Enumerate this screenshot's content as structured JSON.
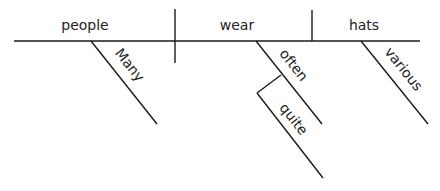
{
  "diagram": {
    "type": "sentence-diagram",
    "sentence_words": {
      "subject": "people",
      "verb": "wear",
      "object": "hats",
      "subject_modifier": "Many",
      "verb_modifier": "often",
      "adverb_modifier": "quite",
      "object_modifier": "various"
    },
    "colors": {
      "line": "#1a1a1a",
      "text": "#222222",
      "background": "#ffffff"
    }
  }
}
